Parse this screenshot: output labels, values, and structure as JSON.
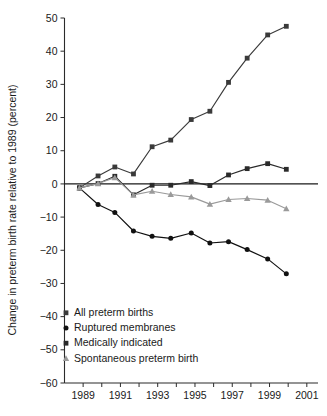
{
  "chart_data": {
    "type": "line",
    "title": "",
    "xlabel": "",
    "ylabel": "Change in preterm birth rate relative to 1989 (percent)",
    "xlim": [
      1988,
      2001.6
    ],
    "ylim": [
      -60,
      50
    ],
    "grid": false,
    "legend_position": "bottom-left-inside",
    "y_ticks": [
      50,
      40,
      30,
      20,
      10,
      0,
      -10,
      -20,
      -30,
      -40,
      -50,
      -60
    ],
    "y_tick_labels": [
      "50",
      "40",
      "30",
      "20",
      "10",
      "0",
      "−10",
      "−20",
      "−30",
      "−40",
      "−50",
      "−60"
    ],
    "x_ticks": [
      1989,
      1990,
      1991,
      1992,
      1993,
      1994,
      1995,
      1996,
      1997,
      1998,
      1999,
      2000,
      2001
    ],
    "x_tick_labels_shown": [
      "1989",
      "1991",
      "1993",
      "1995",
      "1997",
      "1999",
      "2001"
    ],
    "x": [
      1988.8,
      1989.8,
      1990.7,
      1991.7,
      1992.7,
      1993.7,
      1994.8,
      1995.8,
      1996.8,
      1997.8,
      1998.9,
      1999.9
    ],
    "series": [
      {
        "name": "All preterm births",
        "marker": "square",
        "color": "#3a3a3a",
        "values": [
          -1.2,
          2.4,
          5.1,
          3.0,
          11.2,
          13.2,
          19.4,
          21.9,
          30.6,
          37.9,
          44.9,
          47.5
        ]
      },
      {
        "name": "Ruptured membranes",
        "marker": "circle",
        "color": "#111111",
        "values": [
          -1.2,
          -6.2,
          -8.6,
          -14.2,
          -15.8,
          -16.4,
          -14.8,
          -17.8,
          -17.4,
          -19.8,
          -22.6,
          -27.1
        ]
      },
      {
        "name": "Medically indicated",
        "marker": "square",
        "color": "#2a2a2a",
        "values": [
          -1.2,
          0.1,
          2.3,
          -3.3,
          -0.4,
          -0.4,
          0.7,
          -0.5,
          2.7,
          4.6,
          6.1,
          4.4
        ]
      },
      {
        "name": "Spontaneous preterm birth",
        "marker": "triangle",
        "color": "#9a9a9a",
        "values": [
          -1.2,
          0.1,
          1.9,
          -3.3,
          -2.2,
          -3.2,
          -3.9,
          -6.1,
          -4.7,
          -4.4,
          -4.9,
          -7.5
        ]
      }
    ]
  },
  "legend": {
    "items": [
      {
        "label": "All preterm births",
        "marker": "square",
        "color": "#3a3a3a"
      },
      {
        "label": "Ruptured membranes",
        "marker": "circle",
        "color": "#111111"
      },
      {
        "label": "Medically indicated",
        "marker": "square",
        "color": "#2a2a2a"
      },
      {
        "label": "Spontaneous preterm birth",
        "marker": "triangle",
        "color": "#9a9a9a"
      }
    ]
  },
  "axes": {
    "y_title": "Change in preterm birth rate relative to 1989 (percent)"
  }
}
